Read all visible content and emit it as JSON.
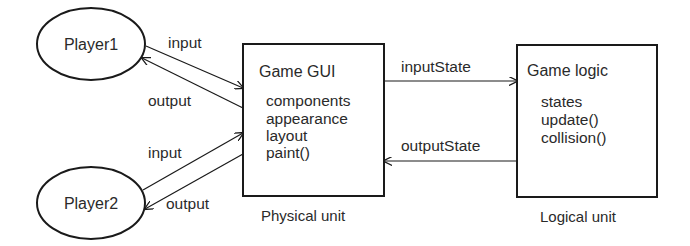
{
  "nodes": {
    "player1": {
      "label": "Player1"
    },
    "player2": {
      "label": "Player2"
    },
    "game_gui": {
      "title": "Game GUI",
      "items": [
        "components",
        "appearance",
        "layout",
        "paint()"
      ],
      "caption": "Physical unit"
    },
    "game_logic": {
      "title": "Game logic",
      "items": [
        "states",
        "update()",
        "collision()"
      ],
      "caption": "Logical unit"
    }
  },
  "edges": {
    "p1_input": {
      "label": "input",
      "from": "Player1",
      "to": "Game GUI"
    },
    "p1_output": {
      "label": "output",
      "from": "Game GUI",
      "to": "Player1"
    },
    "p2_input": {
      "label": "input",
      "from": "Player2",
      "to": "Game GUI"
    },
    "p2_output": {
      "label": "output",
      "from": "Game GUI",
      "to": "Player2"
    },
    "input_state": {
      "label": "inputState",
      "from": "Game GUI",
      "to": "Game logic"
    },
    "output_state": {
      "label": "outputState",
      "from": "Game logic",
      "to": "Game GUI"
    }
  },
  "colors": {
    "stroke": "#1a1a1a",
    "text": "#2a2a2a",
    "background": "#ffffff"
  }
}
